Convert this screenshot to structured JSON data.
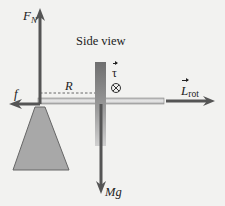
{
  "title": "Side view",
  "labels": {
    "normal_force": "F",
    "normal_force_sub": "N",
    "side_view": "Side view",
    "radius": "R",
    "torque": "τ",
    "friction": "f",
    "angular_momentum": "L",
    "angular_momentum_sub": "rot",
    "weight": "Mg"
  },
  "symbols": {
    "torque_direction": "into-page-circle-x-icon"
  },
  "colors": {
    "background": "#f2f2f0",
    "arrow": "#555555",
    "pedestal_fill": "#a8a8a8",
    "pedestal_stroke": "#666666",
    "axle": "#cfcfcf",
    "wheel_dark": "#7a7a7a",
    "wheel_light": "#c8c8c8",
    "text": "#222222"
  }
}
